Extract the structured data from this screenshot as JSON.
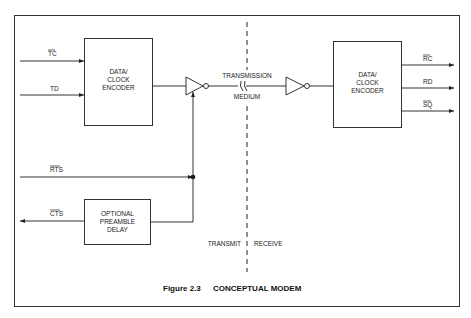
{
  "figure": {
    "caption_number": "Figure 2.3",
    "caption_title": "CONCEPTUAL MODEM"
  },
  "transmit_side": {
    "encoder_box": {
      "lines": [
        "DATA/",
        "CLOCK",
        "ENCODER"
      ]
    },
    "delay_box": {
      "lines": [
        "OPTIONAL",
        "PREAMBLE",
        "DELAY"
      ]
    },
    "signals": {
      "tc": "TC",
      "td": "TD",
      "rts": "RTS",
      "cts": "CTS"
    },
    "side_label": "TRANSMIT"
  },
  "medium": {
    "lines": [
      "TRANSMISSION",
      "MEDIUM"
    ]
  },
  "receive_side": {
    "decoder_box": {
      "lines": [
        "DATA/",
        "CLOCK",
        "ENCODER"
      ]
    },
    "signals": {
      "rc": "RC",
      "rd": "RD",
      "sq": "SQ"
    },
    "side_label": "RECEIVE"
  }
}
